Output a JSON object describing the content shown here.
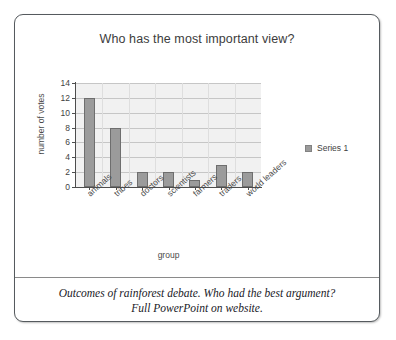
{
  "card": {
    "caption_line_1": "Outcomes of rainforest debate. Who had the best argument?",
    "caption_line_2": "Full PowerPoint on website."
  },
  "legend": {
    "entries": [
      {
        "label": "Series 1",
        "color": "#9b9b9b"
      }
    ]
  },
  "colors": {
    "bar_fill": "#9b9b9b",
    "bar_outline": "#6e6e6e",
    "plot_background": "#f1f1f1",
    "gridline": "#c6c6c6",
    "axis": "#4d4d4d",
    "card_border": "#555a5e"
  },
  "chart_data": {
    "type": "bar",
    "title": "Who has the most important view?",
    "xlabel": "group",
    "ylabel": "number of votes",
    "categories": [
      "animals",
      "tribes",
      "doctors",
      "scientists",
      "farmers",
      "traders",
      "world leaders"
    ],
    "values": [
      12,
      8,
      2,
      2,
      1,
      3,
      2
    ],
    "series": [
      {
        "name": "Series 1",
        "values": [
          12,
          8,
          2,
          2,
          1,
          3,
          2
        ]
      }
    ],
    "ylim": [
      0,
      14
    ],
    "ytick_labels": [
      "0",
      "2",
      "4",
      "6",
      "8",
      "10",
      "12",
      "14"
    ],
    "ytick_values": [
      0,
      2,
      4,
      6,
      8,
      10,
      12,
      14
    ],
    "grid": "horizontal",
    "legend_position": "right",
    "x_tick_label_rotation": -42
  }
}
